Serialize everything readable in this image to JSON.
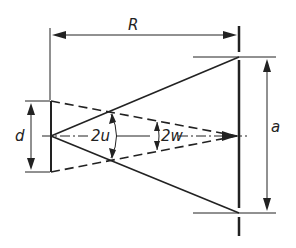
{
  "diagram": {
    "labels": {
      "distance": "R",
      "aperture_diameter": "d",
      "aperture_angle": "2u",
      "field_angle": "2w",
      "screen_width": "a"
    },
    "colors": {
      "line": "#222222",
      "background": "#ffffff"
    }
  }
}
